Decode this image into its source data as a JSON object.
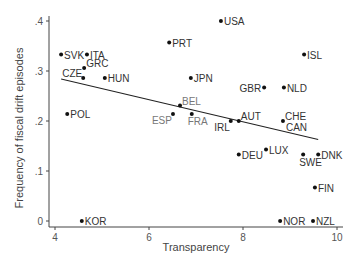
{
  "chart_data": {
    "type": "scatter",
    "title": "",
    "xlabel": "Transparency",
    "ylabel": "Frequency of fiscal drift episodes",
    "xlim": [
      4,
      10
    ],
    "ylim": [
      0,
      0.4
    ],
    "xticks": [
      4,
      6,
      8,
      10
    ],
    "xtick_labels": [
      "4",
      "6",
      "8",
      "10"
    ],
    "yticks": [
      0,
      0.1,
      0.2,
      0.3,
      0.4
    ],
    "ytick_labels": [
      "0",
      ".1",
      ".2",
      ".3",
      ".4"
    ],
    "grid": false,
    "legend": null,
    "points": [
      {
        "label": "SVK",
        "x": 4.13,
        "y": 0.333,
        "label_pos": "right",
        "label_color": "#333333"
      },
      {
        "label": "ITA",
        "x": 4.68,
        "y": 0.333,
        "label_pos": "right",
        "label_color": "#333333"
      },
      {
        "label": "GRC",
        "x": 4.62,
        "y": 0.306,
        "label_pos": "right-up",
        "label_color": "#333333"
      },
      {
        "label": "CZE",
        "x": 4.6,
        "y": 0.286,
        "label_pos": "left-up",
        "label_color": "#333333"
      },
      {
        "label": "HUN",
        "x": 5.06,
        "y": 0.286,
        "label_pos": "right",
        "label_color": "#333333"
      },
      {
        "label": "POL",
        "x": 4.26,
        "y": 0.214,
        "label_pos": "right",
        "label_color": "#333333"
      },
      {
        "label": "KOR",
        "x": 4.57,
        "y": 0.0,
        "label_pos": "right",
        "label_color": "#333333"
      },
      {
        "label": "PRT",
        "x": 6.43,
        "y": 0.357,
        "label_pos": "right",
        "label_color": "#333333"
      },
      {
        "label": "USA",
        "x": 7.53,
        "y": 0.4,
        "label_pos": "right",
        "label_color": "#333333"
      },
      {
        "label": "ISL",
        "x": 9.3,
        "y": 0.333,
        "label_pos": "right",
        "label_color": "#333333"
      },
      {
        "label": "JPN",
        "x": 6.89,
        "y": 0.286,
        "label_pos": "right",
        "label_color": "#333333"
      },
      {
        "label": "GBR",
        "x": 8.45,
        "y": 0.267,
        "label_pos": "left",
        "label_color": "#333333"
      },
      {
        "label": "NLD",
        "x": 8.87,
        "y": 0.267,
        "label_pos": "right",
        "label_color": "#333333"
      },
      {
        "label": "BEL",
        "x": 6.66,
        "y": 0.231,
        "label_pos": "right-up",
        "label_color": "#777777"
      },
      {
        "label": "ESP",
        "x": 6.51,
        "y": 0.214,
        "label_pos": "left-down",
        "label_color": "#777777"
      },
      {
        "label": "FRA",
        "x": 6.91,
        "y": 0.214,
        "label_pos": "below",
        "label_color": "#777777"
      },
      {
        "label": "IRL",
        "x": 7.74,
        "y": 0.2,
        "label_pos": "left-down",
        "label_color": "#333333"
      },
      {
        "label": "AUT",
        "x": 7.91,
        "y": 0.2,
        "label_pos": "right-up",
        "label_color": "#333333"
      },
      {
        "label": "CHE",
        "x": 8.85,
        "y": 0.2,
        "label_pos": "right-up",
        "label_color": "#333333"
      },
      {
        "label": "CAN",
        "x": 8.85,
        "y": 0.2,
        "label_pos": "right-down",
        "label_color": "#333333"
      },
      {
        "label": "DEU",
        "x": 7.91,
        "y": 0.133,
        "label_pos": "right",
        "label_color": "#333333"
      },
      {
        "label": "LUX",
        "x": 8.49,
        "y": 0.143,
        "label_pos": "right",
        "label_color": "#333333"
      },
      {
        "label": "SWE",
        "x": 9.28,
        "y": 0.133,
        "label_pos": "below",
        "label_color": "#333333"
      },
      {
        "label": "DNK",
        "x": 9.6,
        "y": 0.133,
        "label_pos": "right",
        "label_color": "#333333"
      },
      {
        "label": "FIN",
        "x": 9.53,
        "y": 0.067,
        "label_pos": "right",
        "label_color": "#333333"
      },
      {
        "label": "NOR",
        "x": 8.79,
        "y": 0.0,
        "label_pos": "right",
        "label_color": "#333333"
      },
      {
        "label": "NZL",
        "x": 9.49,
        "y": 0.0,
        "label_pos": "right",
        "label_color": "#333333"
      }
    ],
    "fit_line": {
      "type": "linear",
      "x": [
        4.13,
        9.6
      ],
      "y": [
        0.284,
        0.163
      ]
    },
    "colors": {
      "point": "#111111",
      "line": "#222222",
      "axis": "#444444",
      "tick_label": "#555555",
      "axis_label": "#444444"
    }
  }
}
